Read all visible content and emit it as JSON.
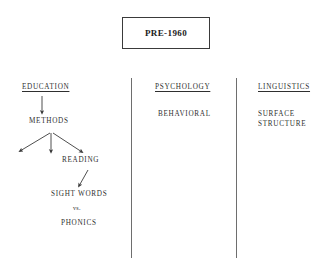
{
  "document": {
    "title_box": {
      "label": "PRE-1960"
    },
    "columns": [
      {
        "id": "education",
        "heading": "EDUCATION",
        "nodes": [
          {
            "id": "methods",
            "label": "METHODS"
          },
          {
            "id": "reading",
            "label": "READING"
          },
          {
            "id": "sight-words",
            "label": "SIGHT WORDS"
          },
          {
            "id": "versus",
            "label": "vs."
          },
          {
            "id": "phonics",
            "label": "PHONICS"
          }
        ]
      },
      {
        "id": "psychology",
        "heading": "PSYCHOLOGY",
        "nodes": [
          {
            "id": "behavioral",
            "label": "BEHAVIORAL"
          }
        ]
      },
      {
        "id": "linguistics",
        "heading": "LINGUISTICS",
        "nodes": [
          {
            "id": "surface-structure",
            "label": "SURFACE\nSTRUCTURE"
          }
        ]
      }
    ]
  },
  "chart_data": {
    "type": "diagram",
    "title": "PRE-1960",
    "subtype": "concept-map",
    "columns": [
      "EDUCATION",
      "PSYCHOLOGY",
      "LINGUISTICS"
    ],
    "nodes": [
      {
        "id": "pre-1960",
        "label": "PRE-1960",
        "shape": "rectangle",
        "column": null
      },
      {
        "id": "education",
        "label": "EDUCATION",
        "column": "EDUCATION",
        "style": "underlined-heading"
      },
      {
        "id": "methods",
        "label": "METHODS",
        "column": "EDUCATION"
      },
      {
        "id": "reading",
        "label": "READING",
        "column": "EDUCATION"
      },
      {
        "id": "sight-words",
        "label": "SIGHT WORDS",
        "column": "EDUCATION"
      },
      {
        "id": "versus",
        "label": "vs.",
        "column": "EDUCATION"
      },
      {
        "id": "phonics",
        "label": "PHONICS",
        "column": "EDUCATION"
      },
      {
        "id": "psychology",
        "label": "PSYCHOLOGY",
        "column": "PSYCHOLOGY",
        "style": "underlined-heading"
      },
      {
        "id": "behavioral",
        "label": "BEHAVIORAL",
        "column": "PSYCHOLOGY"
      },
      {
        "id": "linguistics",
        "label": "LINGUISTICS",
        "column": "LINGUISTICS",
        "style": "underlined-heading"
      },
      {
        "id": "surface-structure",
        "label": "SURFACE STRUCTURE",
        "column": "LINGUISTICS"
      }
    ],
    "edges": [
      {
        "from": "education",
        "to": "methods",
        "type": "arrow"
      },
      {
        "from": "methods",
        "to": "unlabeled-left",
        "type": "arrow"
      },
      {
        "from": "methods",
        "to": "unlabeled-center",
        "type": "arrow"
      },
      {
        "from": "methods",
        "to": "reading",
        "type": "arrow"
      },
      {
        "from": "reading",
        "to": "sight-words",
        "type": "arrow"
      }
    ],
    "colors": {
      "ink": "#2f2f2f",
      "box_border": "#3a3a3a",
      "divider": "#6e6e6e",
      "background": "#ffffff"
    }
  }
}
